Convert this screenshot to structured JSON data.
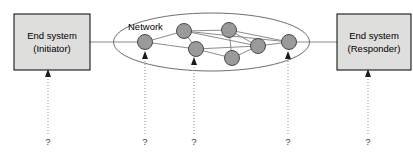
{
  "diagram": {
    "type": "network-topology-diagram",
    "background_color": "#ffffff",
    "endpoints": [
      {
        "id": "initiator",
        "line1": "End system",
        "line2": "(Initiator)",
        "x": 14,
        "y": 14,
        "width": 76,
        "height": 56,
        "fill": "#dededd",
        "stroke": "#000000"
      },
      {
        "id": "responder",
        "line1": "End system",
        "line2": "(Responder)",
        "x": 337,
        "y": 14,
        "width": 76,
        "height": 56,
        "fill": "#dededd",
        "stroke": "#000000"
      }
    ],
    "cloud": {
      "label": "Network",
      "label_x": 128,
      "label_y": 27,
      "cx": 211.5,
      "cy": 42,
      "rx": 98,
      "ry": 29,
      "stroke": "#6f6f6f"
    },
    "nodes": [
      {
        "id": "n1",
        "cx": 145,
        "cy": 42,
        "r": 7.5
      },
      {
        "id": "n2",
        "cx": 184,
        "cy": 31,
        "r": 7.5
      },
      {
        "id": "n3",
        "cx": 229,
        "cy": 30,
        "r": 7.5
      },
      {
        "id": "n4",
        "cx": 196,
        "cy": 49,
        "r": 7.5
      },
      {
        "id": "n5",
        "cx": 258,
        "cy": 46,
        "r": 7.5
      },
      {
        "id": "n6",
        "cx": 232,
        "cy": 58,
        "r": 7.5
      },
      {
        "id": "n7",
        "cx": 289,
        "cy": 42,
        "r": 7.5
      }
    ],
    "edges": [
      {
        "from": "n1",
        "to": "n2"
      },
      {
        "from": "n1",
        "to": "n4"
      },
      {
        "from": "n2",
        "to": "n3"
      },
      {
        "from": "n2",
        "to": "n4"
      },
      {
        "from": "n2",
        "to": "n5"
      },
      {
        "from": "n3",
        "to": "n5"
      },
      {
        "from": "n3",
        "to": "n6"
      },
      {
        "from": "n3",
        "to": "n7"
      },
      {
        "from": "n4",
        "to": "n5"
      },
      {
        "from": "n4",
        "to": "n6"
      },
      {
        "from": "n5",
        "to": "n6"
      },
      {
        "from": "n5",
        "to": "n7"
      },
      {
        "from": "n2",
        "to": "n7"
      }
    ],
    "trunk_links": [
      {
        "id": "initiator-to-network",
        "x1": 90,
        "y1": 42,
        "x2": 145,
        "y2": 42
      },
      {
        "id": "network-to-responder",
        "x1": 289,
        "y1": 42,
        "x2": 337,
        "y2": 42
      }
    ],
    "annotations": [
      {
        "id": "q1",
        "label": "?",
        "x": 48,
        "target_y": 70,
        "label_y": 142,
        "points_to": "initiator"
      },
      {
        "id": "q2",
        "label": "?",
        "x": 145,
        "target_y": 52,
        "label_y": 142,
        "points_to": "n1"
      },
      {
        "id": "q3",
        "label": "?",
        "x": 194,
        "target_y": 58,
        "label_y": 142,
        "points_to": "n4"
      },
      {
        "id": "q4",
        "label": "?",
        "x": 288,
        "target_y": 52,
        "label_y": 142,
        "points_to": "n7"
      },
      {
        "id": "q5",
        "label": "?",
        "x": 368,
        "target_y": 70,
        "label_y": 142,
        "points_to": "responder"
      }
    ]
  }
}
